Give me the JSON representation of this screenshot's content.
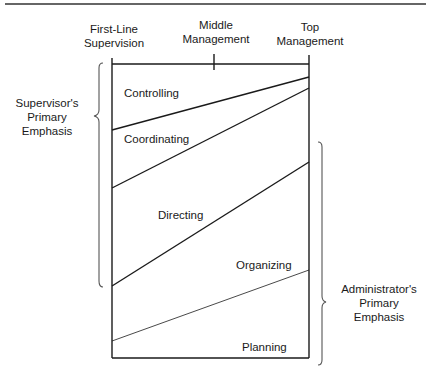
{
  "levels": [
    {
      "label_line1": "First-Line",
      "label_line2": "Supervision"
    },
    {
      "label_line1": "Middle",
      "label_line2": "Management"
    },
    {
      "label_line1": "Top",
      "label_line2": "Management"
    }
  ],
  "bands": [
    {
      "label": "Controlling"
    },
    {
      "label": "Coordinating"
    },
    {
      "label": "Directing"
    },
    {
      "label": "Organizing"
    },
    {
      "label": "Planning"
    }
  ],
  "braces": {
    "left": {
      "line1": "Supervisor's",
      "line2": "Primary",
      "line3": "Emphasis"
    },
    "right": {
      "line1": "Administrator's",
      "line2": "Primary",
      "line3": "Emphasis"
    }
  },
  "colors": {
    "line": "#1a1a1a",
    "brace": "#555555",
    "background": "#ffffff"
  },
  "geometry": {
    "box": {
      "left": 112,
      "right": 309,
      "top": 64,
      "bottom": 358
    },
    "boundaries_left_y": [
      130,
      188,
      286,
      341
    ],
    "boundaries_right_y": [
      77,
      88,
      162,
      270
    ]
  }
}
